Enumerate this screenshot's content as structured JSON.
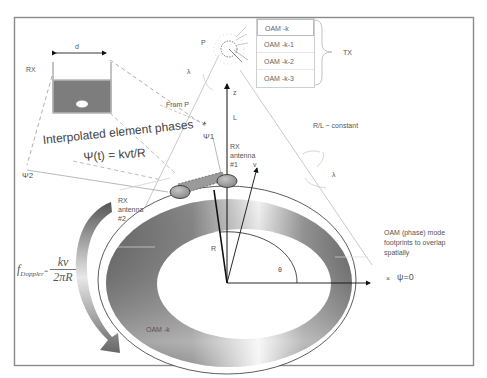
{
  "diagram": {
    "colors": {
      "frame": "#8a8a8a",
      "ring_dark": "#6f6f6f",
      "ring_light": "#f2f2f2",
      "antenna_fill": "#9a9a9a",
      "rx_panel": "#7d7d7d",
      "arrow": "#777777"
    },
    "tx": {
      "point_label": "P",
      "wavelength_label": "λ",
      "group_label": "TX",
      "modes": [
        "OAM -k",
        "OAM -k-1",
        "OAM -k-2",
        "OAM -k-3"
      ]
    },
    "rx_array": {
      "label": "RX",
      "spacing_label": "d"
    },
    "labels": {
      "from_p": "From P",
      "z_axis": "z",
      "length": "L",
      "psi1": "Ψ1",
      "psi2": "Ψ2",
      "rx_antenna_1": [
        "RX",
        "antenna",
        "#1"
      ],
      "rx_antenna_2": [
        "RX",
        "antenna",
        "#2"
      ],
      "velocity": "v",
      "radius": "R",
      "angle": "θ",
      "ratio_constant": "R/L ~ constant",
      "wavelength_right": "λ",
      "oam_ring": "OAM -k",
      "footprint_note": [
        "OAM (phase) mode",
        "footprints to overlap",
        "spatially"
      ],
      "psi_zero_marker": "×",
      "psi_zero": "ψ=0"
    },
    "formula": {
      "title": "Interpolated element phases",
      "equation": "Ψ(t) = kvt/R",
      "doppler_f": "f",
      "doppler_sub": "Doppler",
      "doppler_eq": "=",
      "doppler_num": "kv",
      "doppler_den": "2πR"
    }
  }
}
